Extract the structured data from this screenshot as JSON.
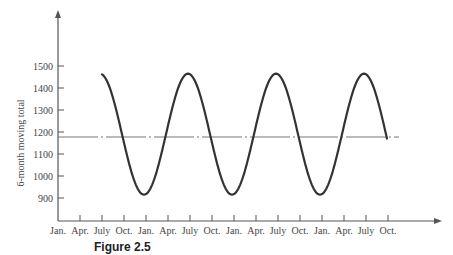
{
  "chart_data": {
    "type": "line",
    "title": "",
    "caption": "Figure 2.5",
    "xlabel": "",
    "ylabel": "6-month moving total",
    "ylim": [
      820,
      1700
    ],
    "y_ticks": [
      900,
      1000,
      1100,
      1200,
      1300,
      1400,
      1500
    ],
    "x_ticks": [
      "Jan.",
      "Apr.",
      "July",
      "Oct.",
      "Jan.",
      "Apr.",
      "July",
      "Oct.",
      "Jan.",
      "Apr.",
      "July",
      "Oct.",
      "Jan.",
      "Apr.",
      "July",
      "Oct."
    ],
    "grid": false,
    "legend": null,
    "series": [
      {
        "name": "6-month moving total",
        "style": "solid",
        "x": [
          "July",
          "Oct.",
          "Jan.",
          "Apr.",
          "July",
          "Oct.",
          "Jan.",
          "Apr.",
          "July",
          "Oct.",
          "Jan.",
          "Apr.",
          "July",
          "Oct."
        ],
        "values": [
          1470,
          1185,
          915,
          1185,
          1465,
          1185,
          915,
          1185,
          1465,
          1185,
          915,
          1185,
          1465,
          1185
        ]
      },
      {
        "name": "mean level",
        "style": "dash-dot",
        "x": [
          "Jan.",
          "Oct."
        ],
        "values": [
          1185,
          1185
        ]
      }
    ],
    "annotations": []
  },
  "geometry": {
    "origin_x": 58,
    "origin_y": 221,
    "y_axis_top": 10,
    "x_axis_right": 442,
    "px_per_100": 22,
    "y_at_1500": 66,
    "first_tick_x": 80,
    "tick_spacing": 22,
    "tick_count": 15,
    "mean_line_y": 137,
    "mean_line_x_end": 399
  },
  "colors": {
    "axis": "#555555",
    "curve": "#333333",
    "mean_line": "#777777",
    "text": "#444444"
  }
}
